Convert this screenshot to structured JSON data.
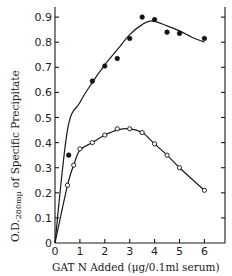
{
  "chart_data": {
    "type": "line",
    "title": "",
    "xlabel": "GAT N Added (μg/0.1ml serum)",
    "ylabel": {
      "prefix": "O.D.",
      "subscript": "280mμ",
      "suffix": " of Specific Precipitate"
    },
    "xlim": [
      0,
      6.5
    ],
    "ylim": [
      0,
      0.93
    ],
    "xticks": [
      0,
      1,
      2,
      3,
      4,
      5,
      6
    ],
    "yticks": [
      0,
      0.1,
      0.2,
      0.3,
      0.4,
      0.5,
      0.6,
      0.7,
      0.8,
      0.9
    ],
    "ytick_labels": [
      "0",
      "0.1",
      "0.2",
      "0.3",
      "0.4",
      "0.5",
      "0.6",
      "0.7",
      "0.8",
      "0.9"
    ],
    "grid": false,
    "legend": null,
    "series": [
      {
        "name": "filled circles",
        "marker": "filled-circle",
        "x": [
          0.55,
          1.5,
          2.0,
          2.5,
          3.0,
          3.5,
          4.0,
          4.5,
          5.0,
          6.0
        ],
        "y": [
          0.35,
          0.645,
          0.705,
          0.735,
          0.815,
          0.9,
          0.89,
          0.84,
          0.835,
          0.815
        ],
        "fit_curve": {
          "x": [
            0,
            0.5,
            1.0,
            1.5,
            2.0,
            2.5,
            3.0,
            3.5,
            3.9,
            4.5,
            5.0,
            5.5,
            6.0
          ],
          "y": [
            0,
            0.45,
            0.56,
            0.64,
            0.71,
            0.77,
            0.83,
            0.87,
            0.885,
            0.865,
            0.845,
            0.82,
            0.8
          ]
        }
      },
      {
        "name": "open circles",
        "marker": "open-circle",
        "x": [
          0.5,
          0.75,
          1.0,
          1.5,
          2.0,
          2.5,
          3.0,
          3.5,
          4.0,
          4.5,
          5.0,
          6.0
        ],
        "y": [
          0.23,
          0.31,
          0.375,
          0.4,
          0.43,
          0.455,
          0.455,
          0.44,
          0.395,
          0.35,
          0.3,
          0.21
        ],
        "fit_curve": {
          "x": [
            0,
            0.5,
            0.75,
            1.0,
            1.5,
            2.0,
            2.5,
            3.0,
            3.5,
            4.0,
            4.5,
            5.0,
            6.0
          ],
          "y": [
            0,
            0.23,
            0.31,
            0.37,
            0.4,
            0.43,
            0.45,
            0.455,
            0.44,
            0.395,
            0.35,
            0.3,
            0.21
          ]
        }
      }
    ]
  }
}
